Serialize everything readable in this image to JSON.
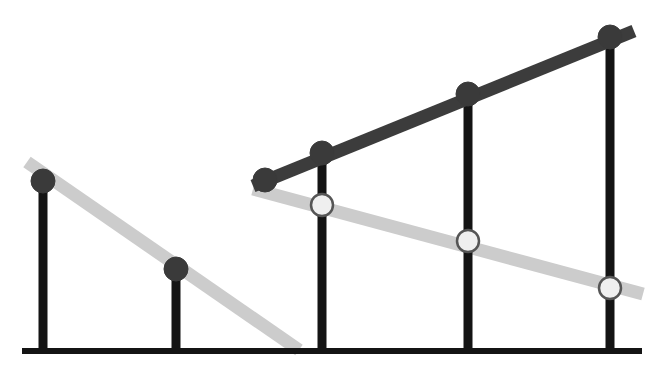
{
  "chart_data": {
    "type": "line",
    "title": "",
    "subtitle": "",
    "xlabel": "",
    "ylabel": "",
    "grid": false,
    "legend": null,
    "axis": {
      "baseline_y": 351,
      "baseline_x_start": 22,
      "baseline_x_end": 642,
      "xlim": [
        0,
        664
      ],
      "ylim_pixels": [
        375,
        0
      ],
      "y_axis_visible": false,
      "x_axis_visible": true
    },
    "categories": [
      "1",
      "2",
      "3",
      "4",
      "5"
    ],
    "bar_x_positions": [
      43,
      176,
      322,
      468,
      610
    ],
    "series": [
      {
        "name": "dark-series",
        "color": "#3c3c3c",
        "marker": "filled-circle",
        "marker_fill": "#3a3a3a",
        "marker_stroke": "#3a3a3a",
        "points": [
          {
            "x": 265,
            "y": 180,
            "has_bar": false
          },
          {
            "x": 322,
            "y": 153,
            "has_bar": true
          },
          {
            "x": 468,
            "y": 94,
            "has_bar": true
          },
          {
            "x": 610,
            "y": 37,
            "has_bar": true
          }
        ],
        "line_start": {
          "x": 253,
          "y": 186
        },
        "line_end": {
          "x": 634,
          "y": 31
        }
      },
      {
        "name": "light-series-left",
        "color": "#cccccc",
        "marker": "filled-circle",
        "marker_fill": "#3a3a3a",
        "marker_stroke": "#3a3a3a",
        "points": [
          {
            "x": 43,
            "y": 181,
            "has_bar": true
          },
          {
            "x": 176,
            "y": 269,
            "has_bar": true
          }
        ],
        "line_start": {
          "x": 27,
          "y": 162
        },
        "line_end": {
          "x": 299,
          "y": 350
        }
      },
      {
        "name": "light-series-right",
        "color": "#cccccc",
        "marker": "hollow-circle",
        "marker_fill": "#efefef",
        "marker_stroke": "#555555",
        "points": [
          {
            "x": 322,
            "y": 205,
            "has_bar": true
          },
          {
            "x": 468,
            "y": 241,
            "has_bar": true
          },
          {
            "x": 610,
            "y": 288,
            "has_bar": true
          }
        ],
        "line_start": {
          "x": 253,
          "y": 189
        },
        "line_end": {
          "x": 643,
          "y": 294
        }
      }
    ],
    "bars": [
      {
        "x": 43,
        "top": 181,
        "bottom": 351,
        "width": 9,
        "color": "#141414"
      },
      {
        "x": 176,
        "top": 269,
        "bottom": 351,
        "width": 9,
        "color": "#141414"
      },
      {
        "x": 322,
        "top": 153,
        "bottom": 351,
        "width": 9,
        "color": "#141414"
      },
      {
        "x": 468,
        "top": 94,
        "bottom": 351,
        "width": 9,
        "color": "#141414"
      },
      {
        "x": 610,
        "top": 37,
        "bottom": 351,
        "width": 9,
        "color": "#141414"
      }
    ],
    "style": {
      "line_width_dark": 13,
      "line_width_light": 13,
      "marker_radius_filled": 12,
      "marker_radius_hollow": 11,
      "baseline_thickness": 6,
      "background": "#ffffff"
    }
  }
}
